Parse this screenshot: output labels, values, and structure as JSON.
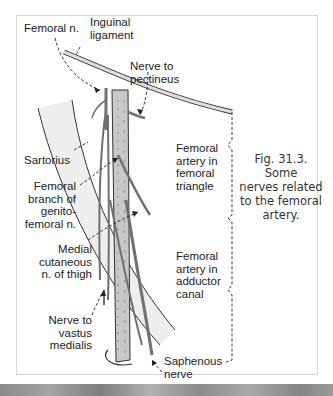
{
  "figure": {
    "caption": "Fig. 31.3. Some\nnerves related\nto the femoral\nartery.",
    "colors": {
      "artery_fill": "#c8c8c8",
      "nerve": "#707070",
      "sartorius_fill": "#eeeeee",
      "outline": "#333333",
      "frame_border": "#d8d8d8"
    },
    "labels": {
      "femoral_n": "Femoral n.",
      "inguinal_ligament": "Inguinal\nligament",
      "nerve_to_pectineus": "Nerve to\npectineus",
      "sartorius": "Sartorius",
      "femoral_branch": "Femoral\nbranch of\ngenito-\nfemoral n.",
      "medial_cutaneous": "Medial\ncutaneous\nn. of thigh",
      "nerve_to_vastus": "Nerve to\nvastus\nmedialis",
      "saphenous": "Saphenous\nnerve",
      "femoral_triangle": "Femoral\nartery in\nfemoral\ntriangle",
      "adductor_canal": "Femoral\nartery in\nadductor\ncanal"
    }
  }
}
